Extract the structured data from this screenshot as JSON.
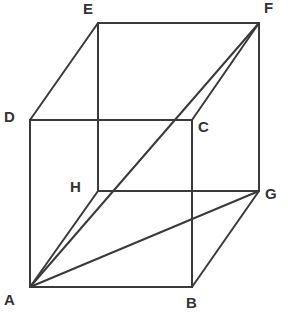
{
  "diagram": {
    "type": "cube-with-diagonals",
    "colors": {
      "line": "#3a3a3a",
      "label": "#333333",
      "background": "#ffffff"
    },
    "vertices": {
      "A": {
        "label": "A",
        "x": 30,
        "y": 287,
        "lx": 4,
        "ly": 305
      },
      "B": {
        "label": "B",
        "x": 192,
        "y": 287,
        "lx": 186,
        "ly": 308
      },
      "C": {
        "label": "C",
        "x": 192,
        "y": 120,
        "lx": 198,
        "ly": 132
      },
      "D": {
        "label": "D",
        "x": 30,
        "y": 120,
        "lx": 4,
        "ly": 122
      },
      "E": {
        "label": "E",
        "x": 98,
        "y": 23,
        "lx": 83,
        "ly": 14
      },
      "F": {
        "label": "F",
        "x": 259,
        "y": 23,
        "lx": 264,
        "ly": 13
      },
      "G": {
        "label": "G",
        "x": 259,
        "y": 191,
        "lx": 265,
        "ly": 199
      },
      "H": {
        "label": "H",
        "x": 98,
        "y": 191,
        "lx": 70,
        "ly": 192
      }
    },
    "edges": [
      [
        "A",
        "B"
      ],
      [
        "B",
        "C"
      ],
      [
        "C",
        "D"
      ],
      [
        "D",
        "A"
      ],
      [
        "E",
        "F"
      ],
      [
        "F",
        "G"
      ],
      [
        "G",
        "H"
      ],
      [
        "H",
        "E"
      ],
      [
        "A",
        "H"
      ],
      [
        "B",
        "G"
      ],
      [
        "C",
        "F"
      ],
      [
        "D",
        "E"
      ],
      [
        "A",
        "F"
      ],
      [
        "A",
        "G"
      ]
    ]
  }
}
